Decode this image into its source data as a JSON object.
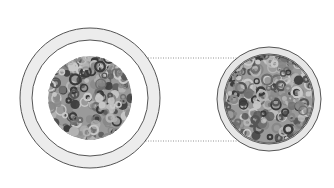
{
  "diagram": {
    "width": 334,
    "height": 188,
    "background": "#ffffff",
    "left_view": {
      "cx": 90,
      "cy": 98,
      "outer_ring_radius": 70,
      "inner_ring_radius": 58,
      "ring_fill": "#ececec",
      "ring_stroke": "#555555",
      "sample_radius": 42,
      "sample_base": "#9a9a9a"
    },
    "right_view": {
      "cx": 269,
      "cy": 99,
      "outer_ring_radius": 52,
      "inner_ring_radius": 45,
      "ring_fill": "#e6e6e6",
      "ring_stroke": "#555555",
      "sample_radius": 44,
      "sample_base": "#9a9a9a"
    },
    "connector_lines": [
      {
        "x1": 98,
        "y1": 58,
        "x2": 245,
        "y2": 58
      },
      {
        "x1": 98,
        "y1": 141,
        "x2": 245,
        "y2": 141
      }
    ],
    "connector_color": "#777777",
    "texture_colors": [
      "#3a3a3a",
      "#555555",
      "#6e6e6e",
      "#888888",
      "#b5b5b5",
      "#c8c8c8"
    ]
  }
}
